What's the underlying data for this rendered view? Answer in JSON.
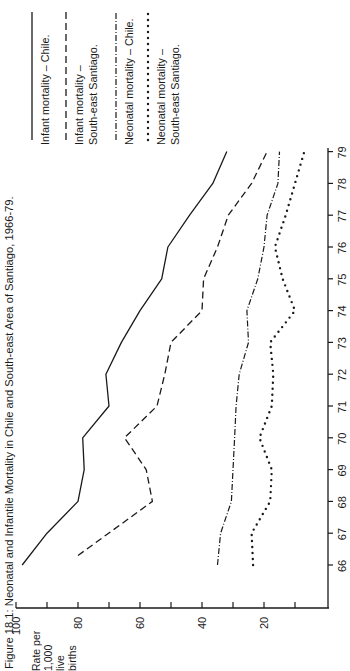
{
  "figure": {
    "title": "Figure 18.1: Neonatal and Infantile Mortality in Chile and South-east Area of Santiago, 1966-79.",
    "orientation": "rotated 90° counter-clockwise"
  },
  "legend": [
    {
      "id": "infant_chile",
      "line1": "Infant mortality – Chile.",
      "line2": "",
      "style": "solid"
    },
    {
      "id": "infant_se",
      "line1": "Infant mortality –",
      "line2": "South-east Santiago.",
      "style": "dashed"
    },
    {
      "id": "neonatal_chile",
      "line1": "Neonatal mortality – Chile.",
      "line2": "",
      "style": "dashdot"
    },
    {
      "id": "neonatal_se",
      "line1": "Neonatal mortality –",
      "line2": "South-east Santiago.",
      "style": "dotted"
    }
  ],
  "axis": {
    "ylabel_lines": [
      "Rate per",
      "1,000",
      "live",
      "births"
    ],
    "y_ticks": [
      "100",
      "80",
      "60",
      "40",
      "20"
    ],
    "x_ticks": [
      "66",
      "67",
      "68",
      "69",
      "70",
      "71",
      "72",
      "73",
      "74",
      "75",
      "76",
      "77",
      "78",
      "79"
    ]
  },
  "colors": {
    "ink": "#1a1a1a",
    "background": "#ffffff"
  },
  "chart_data": {
    "type": "line",
    "title": "Figure 18.1: Neonatal and Infantile Mortality in Chile and South-east Area of Santiago, 1966-79.",
    "xlabel": "Year",
    "ylabel": "Rate per 1,000 live births",
    "x": [
      66,
      67,
      68,
      69,
      70,
      71,
      72,
      73,
      74,
      75,
      76,
      77,
      78,
      79
    ],
    "ylim": [
      0,
      100
    ],
    "y_ticks": [
      20,
      40,
      60,
      80,
      100
    ],
    "grid": false,
    "legend_position": "top-right",
    "series": [
      {
        "name": "Infant mortality – Chile",
        "style": "solid",
        "values": [
          98,
          90,
          80,
          78,
          78.5,
          70,
          71,
          66,
          60,
          53,
          51,
          44,
          36.5,
          32
        ]
      },
      {
        "name": "Infant mortality – South-east Santiago",
        "style": "dashed",
        "values": [
          null,
          80,
          56,
          58,
          65,
          54.5,
          52,
          50,
          40,
          39.5,
          35,
          31.5,
          24,
          19
        ]
      },
      {
        "name": "Neonatal mortality – Chile",
        "style": "dash-dot",
        "values": [
          35,
          34,
          30.5,
          30,
          29.5,
          29,
          28,
          25,
          25.5,
          22,
          20,
          19,
          15.5,
          15
        ]
      },
      {
        "name": "Neonatal mortality – South-east Santiago",
        "style": "dotted",
        "values": [
          23.5,
          24,
          18,
          17.5,
          21.5,
          17.5,
          17,
          18,
          10,
          14,
          16.5,
          13,
          10,
          7
        ]
      }
    ]
  }
}
